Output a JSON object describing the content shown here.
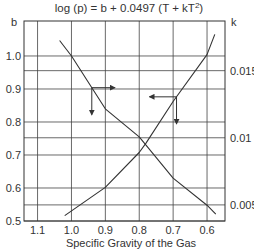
{
  "chart_data": {
    "type": "line",
    "title_parts": {
      "main": "log (p) = b + 0.0497 (T + kT",
      "sup": "2",
      "end": ")"
    },
    "xlabel": "Specific Gravity of the Gas",
    "ylabel_left": "b",
    "ylabel_right": "k",
    "x_ticks": [
      "1.1",
      "1.0",
      "0.9",
      "0.8",
      "0.7",
      "0.6"
    ],
    "x_tick_values": [
      1.1,
      1.0,
      0.9,
      0.8,
      0.7,
      0.6
    ],
    "x_reversed": true,
    "xlim": [
      1.14,
      0.547
    ],
    "y_left_ticks": [
      "1.0",
      "0.9",
      "0.8",
      "0.7",
      "0.6",
      "0.5"
    ],
    "y_left_tick_values": [
      1.0,
      0.9,
      0.8,
      0.7,
      0.6,
      0.5
    ],
    "ylim_left": [
      0.5,
      1.106
    ],
    "y_right_ticks": [
      "0.015",
      "0.01",
      "0.005"
    ],
    "y_right_tick_values": [
      0.015,
      0.01,
      0.005
    ],
    "ylim_right": [
      0.0038,
      0.0187
    ],
    "grid": true,
    "series": [
      {
        "name": "b",
        "axis": "left",
        "x": [
          1.035,
          1.0,
          0.9,
          0.8,
          0.78,
          0.7,
          0.6,
          0.574
        ],
        "y": [
          1.047,
          1.0,
          0.84,
          0.755,
          0.73,
          0.63,
          0.548,
          0.521
        ]
      },
      {
        "name": "k",
        "axis": "right",
        "x": [
          1.02,
          0.9,
          0.8,
          0.78,
          0.7,
          0.6,
          0.577
        ],
        "y": [
          0.0042,
          0.0063,
          0.0089,
          0.0096,
          0.0127,
          0.0162,
          0.0177
        ]
      }
    ],
    "annotations": [
      {
        "type": "arrow-pair",
        "curve": "b",
        "origin_sg": 0.94,
        "directions": [
          "right",
          "down"
        ]
      },
      {
        "type": "arrow-pair",
        "curve": "k",
        "origin_sg": 0.69,
        "directions": [
          "left",
          "down"
        ]
      }
    ]
  }
}
